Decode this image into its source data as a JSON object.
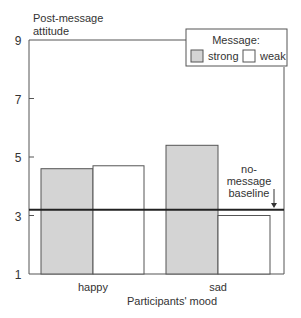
{
  "chart_data": {
    "type": "bar",
    "title": "",
    "ylabel": "Post-message attitude",
    "ylabel_lines": [
      "Post-message",
      "attitude"
    ],
    "xlabel": "Participants' mood",
    "categories": [
      "happy",
      "sad"
    ],
    "series": [
      {
        "name": "strong",
        "values": [
          4.6,
          5.4
        ],
        "color": "#d4d4d4"
      },
      {
        "name": "weak",
        "values": [
          4.7,
          3.0
        ],
        "color": "#ffffff"
      }
    ],
    "reference_line": {
      "label_lines": [
        "no-",
        "message",
        "baseline"
      ],
      "value": 3.2
    },
    "legend": {
      "title": "Message:",
      "entries": [
        "strong",
        "weak"
      ],
      "position": "top-right"
    },
    "yticks": [
      1,
      3,
      5,
      7,
      9
    ],
    "ylim": [
      1,
      9
    ],
    "grid": false
  }
}
